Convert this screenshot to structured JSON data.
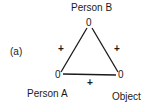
{
  "panel_label": "(a)",
  "nodes": {
    "top": {
      "label": "Person B",
      "value": "0"
    },
    "left": {
      "label": "Person A",
      "value": "0"
    },
    "right": {
      "label": "Object",
      "value": "0"
    }
  },
  "edges": {
    "left_top": {
      "sign": "+"
    },
    "right_top": {
      "sign": "+"
    },
    "left_right": {
      "sign": "+"
    }
  },
  "colors": {
    "line": "#1a1a1a",
    "background": "#ffffff"
  }
}
